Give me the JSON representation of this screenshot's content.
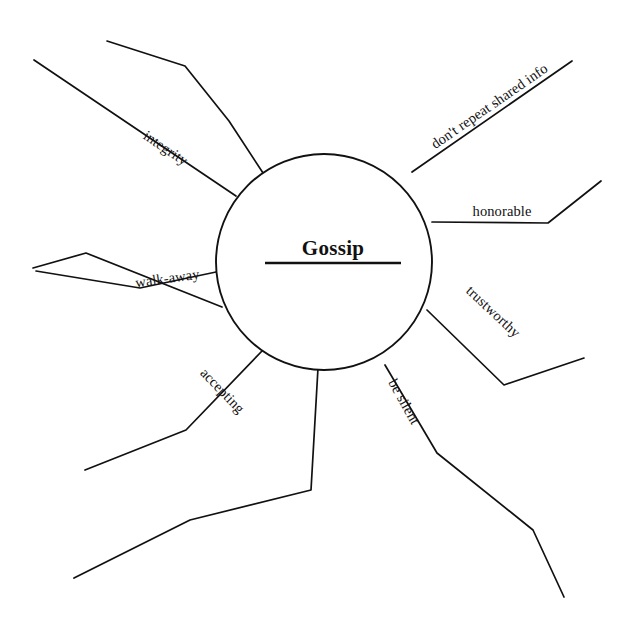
{
  "diagram": {
    "type": "mind-map",
    "title": "Gossip",
    "canvas": {
      "width": 637,
      "height": 638,
      "background": "#ffffff"
    },
    "stroke_color": "#111111",
    "center": {
      "label": "Gossip",
      "cx": 324,
      "cy": 262,
      "r": 108,
      "label_x": 333,
      "label_y": 255,
      "underline_x1": 265,
      "underline_x2": 401,
      "underline_y": 263
    },
    "branches": [
      {
        "id": "branch-unlabeled-top-left",
        "label": "",
        "points": "265,176 229,121 185,66 107,41"
      },
      {
        "id": "branch-integrity",
        "label": "integrity",
        "points": "236,196 34,60",
        "label_x": 163,
        "label_y": 152,
        "label_rotate": 33.9
      },
      {
        "id": "branch-walk-away",
        "label": "walk-away",
        "points": "216,272 140,288 36,271",
        "label_x": 168,
        "label_y": 283,
        "label_rotate": -8.0
      },
      {
        "id": "branch-unlabeled-left-lower",
        "label": "",
        "points": "222,307 86,253 33,268"
      },
      {
        "id": "branch-accepting",
        "label": "accepting",
        "points": "262,351 186,430 85,470",
        "label_x": 219,
        "label_y": 394,
        "label_rotate": 46.0
      },
      {
        "id": "branch-unlabeled-bottom-left",
        "label": "",
        "points": "318,368 311,490 190,520 74,578"
      },
      {
        "id": "branch-be-silent",
        "label": "be silent",
        "points": "385,365 437,453 533,530 564,597",
        "label_x": 400,
        "label_y": 404,
        "label_rotate": 61.0
      },
      {
        "id": "branch-trustworthy",
        "label": "trustworthy",
        "points": "427,310 504,385 584,358",
        "label_x": 490,
        "label_y": 315,
        "label_rotate": 43.0
      },
      {
        "id": "branch-honorable",
        "label": "honorable",
        "points": "432,222 548,223 601,181",
        "label_x": 502,
        "label_y": 216,
        "label_rotate": 0.0
      },
      {
        "id": "branch-dont-repeat-shared-info",
        "label": "don't repeat shared info",
        "points": "412,172 572,61",
        "label_x": 492,
        "label_y": 110,
        "label_rotate": -34.7
      }
    ]
  }
}
